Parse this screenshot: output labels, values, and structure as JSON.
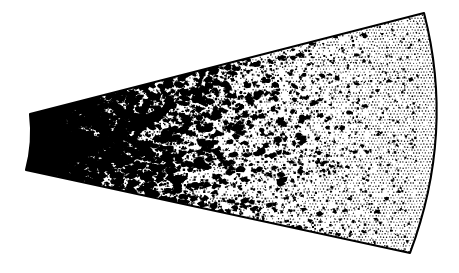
{
  "figure": {
    "title": "Sector scan density map",
    "canvas": {
      "width": 459,
      "height": 273,
      "background_color": "#ffffff"
    },
    "outline": {
      "stroke_color": "#000000",
      "stroke_width": 2.1,
      "fill_color": "#ffffff",
      "shape_name": "annular-sector-wedge"
    },
    "geometry": {
      "apex_top": [
        30,
        114
      ],
      "apex_bottom": [
        26,
        170
      ],
      "far_top": [
        424,
        13
      ],
      "far_bottom": [
        410,
        253
      ],
      "left_edge_type": "concave-arc",
      "right_edge_type": "convex-arc",
      "right_edge_bulge_x": 441,
      "top_edge_type": "straight",
      "bottom_edge_type": "straight"
    },
    "texture": {
      "base_name": "halftone-stipple",
      "dot_color": "#000000",
      "dot_pitch_px": 3,
      "dot_radius_px": 0.62,
      "blob_color": "#000000"
    }
  },
  "chart_data": {
    "type": "heatmap",
    "title": "Sector scan density map",
    "subtitle": "",
    "xlabel": "",
    "ylabel": "",
    "grid": false,
    "legend": "none",
    "annotations": [],
    "tick_labels": [],
    "coordinate_system": "polar-sector",
    "radial_bins": [
      0,
      1,
      2,
      3,
      4,
      5,
      6,
      7,
      8,
      9
    ],
    "radial_bin_labels": [
      "r0",
      "r1",
      "r2",
      "r3",
      "r4",
      "r5",
      "r6",
      "r7",
      "r8",
      "r9"
    ],
    "series": [
      {
        "name": "blob coverage (%)",
        "values": [
          62,
          48,
          41,
          36,
          30,
          24,
          17,
          9,
          4,
          2
        ]
      },
      {
        "name": "stipple density (%)",
        "values": [
          38,
          35,
          33,
          31,
          30,
          32,
          36,
          44,
          52,
          58
        ]
      }
    ],
    "colors": {
      "ink": "#000000",
      "paper": "#ffffff"
    },
    "blob_clusters": [
      {
        "cx": 0.045,
        "cy": 0.505,
        "r": 0.052,
        "w": 1.0
      },
      {
        "cx": 0.072,
        "cy": 0.47,
        "r": 0.04,
        "w": 0.95
      },
      {
        "cx": 0.1,
        "cy": 0.53,
        "r": 0.036,
        "w": 0.92
      },
      {
        "cx": 0.062,
        "cy": 0.575,
        "r": 0.03,
        "w": 0.88
      },
      {
        "cx": 0.13,
        "cy": 0.49,
        "r": 0.032,
        "w": 0.82
      },
      {
        "cx": 0.118,
        "cy": 0.62,
        "r": 0.028,
        "w": 0.78
      },
      {
        "cx": 0.165,
        "cy": 0.545,
        "r": 0.03,
        "w": 0.76
      },
      {
        "cx": 0.195,
        "cy": 0.44,
        "r": 0.028,
        "w": 0.72
      },
      {
        "cx": 0.21,
        "cy": 0.64,
        "r": 0.03,
        "w": 0.7
      },
      {
        "cx": 0.25,
        "cy": 0.52,
        "r": 0.028,
        "w": 0.68
      },
      {
        "cx": 0.27,
        "cy": 0.36,
        "r": 0.026,
        "w": 0.66
      },
      {
        "cx": 0.3,
        "cy": 0.6,
        "r": 0.026,
        "w": 0.64
      },
      {
        "cx": 0.33,
        "cy": 0.3,
        "r": 0.026,
        "w": 0.62
      },
      {
        "cx": 0.345,
        "cy": 0.47,
        "r": 0.026,
        "w": 0.6
      },
      {
        "cx": 0.375,
        "cy": 0.69,
        "r": 0.024,
        "w": 0.56
      },
      {
        "cx": 0.405,
        "cy": 0.4,
        "r": 0.024,
        "w": 0.54
      },
      {
        "cx": 0.43,
        "cy": 0.25,
        "r": 0.022,
        "w": 0.52
      },
      {
        "cx": 0.455,
        "cy": 0.56,
        "r": 0.024,
        "w": 0.5
      },
      {
        "cx": 0.49,
        "cy": 0.33,
        "r": 0.022,
        "w": 0.46
      },
      {
        "cx": 0.515,
        "cy": 0.68,
        "r": 0.022,
        "w": 0.44
      },
      {
        "cx": 0.545,
        "cy": 0.45,
        "r": 0.02,
        "w": 0.4
      },
      {
        "cx": 0.575,
        "cy": 0.26,
        "r": 0.02,
        "w": 0.38
      },
      {
        "cx": 0.6,
        "cy": 0.6,
        "r": 0.02,
        "w": 0.36
      },
      {
        "cx": 0.64,
        "cy": 0.42,
        "r": 0.018,
        "w": 0.32
      },
      {
        "cx": 0.665,
        "cy": 0.74,
        "r": 0.018,
        "w": 0.3
      },
      {
        "cx": 0.7,
        "cy": 0.52,
        "r": 0.018,
        "w": 0.26
      },
      {
        "cx": 0.735,
        "cy": 0.33,
        "r": 0.016,
        "w": 0.22
      },
      {
        "cx": 0.76,
        "cy": 0.64,
        "r": 0.016,
        "w": 0.2
      },
      {
        "cx": 0.8,
        "cy": 0.47,
        "r": 0.014,
        "w": 0.16
      },
      {
        "cx": 0.835,
        "cy": 0.25,
        "r": 0.012,
        "w": 0.12
      },
      {
        "cx": 0.86,
        "cy": 0.7,
        "r": 0.012,
        "w": 0.1
      },
      {
        "cx": 0.9,
        "cy": 0.5,
        "r": 0.01,
        "w": 0.07
      }
    ]
  }
}
